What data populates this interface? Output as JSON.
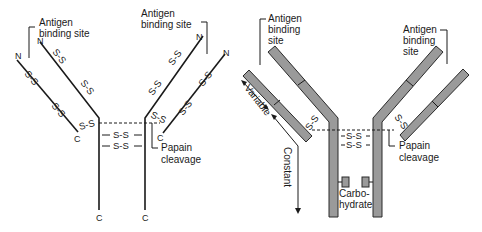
{
  "left_diagram": {
    "title": "Antibody chain schematic (line)",
    "labels": {
      "antigen_left_line1": "Antigen",
      "antigen_left_line2": "binding site",
      "antigen_right_line1": "Antigen",
      "antigen_right_line2": "binding site",
      "papain_line1": "Papain",
      "papain_line2": "cleavage"
    },
    "disulfide": "S-S",
    "terminals": {
      "n": "N",
      "c": "C"
    }
  },
  "right_diagram": {
    "title": "Antibody domain schematic (block)",
    "labels": {
      "antigen_left_line1": "Antigen",
      "antigen_left_line2": "binding",
      "antigen_left_line3": "site",
      "antigen_right_line1": "Antigen",
      "antigen_right_line2": "binding",
      "antigen_right_line3": "site",
      "papain_line1": "Papain",
      "papain_line2": "cleavage",
      "variable": "Variable",
      "constant": "Constant",
      "carbo_line1": "Carbo-",
      "carbo_line2": "hydrate"
    },
    "disulfide": "S-S",
    "chain_color": "#9a9a9a"
  }
}
